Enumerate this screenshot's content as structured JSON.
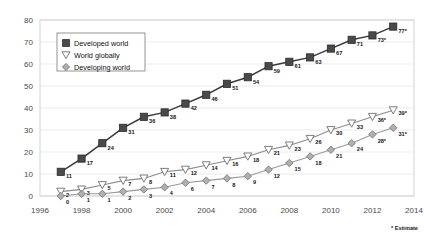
{
  "chart_data": {
    "type": "line",
    "title": "",
    "subtitle": "",
    "xlabel": "",
    "ylabel": "",
    "xlim": [
      1996,
      2014
    ],
    "ylim": [
      0,
      80
    ],
    "x_ticks": [
      "1996",
      "1998",
      "2000",
      "2002",
      "2004",
      "2006",
      "2008",
      "2010",
      "2012",
      "2014"
    ],
    "y_ticks": [
      "0",
      "10",
      "20",
      "30",
      "40",
      "50",
      "60",
      "70",
      "80"
    ],
    "grid": true,
    "legend_position": "upper-left-inside",
    "x": [
      1997,
      1998,
      1999,
      2000,
      2001,
      2002,
      2003,
      2004,
      2005,
      2006,
      2007,
      2008,
      2009,
      2010,
      2011,
      2012,
      2013
    ],
    "series": [
      {
        "name": "Developed world",
        "marker": "filled-square",
        "color": "#3a3a3a",
        "values": [
          11,
          17,
          24,
          31,
          36,
          38,
          42,
          46,
          51,
          54,
          59,
          61,
          63,
          67,
          71,
          73,
          77
        ],
        "labels": [
          "11",
          "17",
          "24",
          "31",
          "36",
          "38",
          "42",
          "46",
          "51",
          "54",
          "59",
          "61",
          "63",
          "67",
          "71",
          "73*",
          "77*"
        ]
      },
      {
        "name": "World globally",
        "marker": "open-triangle-down",
        "color": "#8c8c8c",
        "values": [
          2,
          3,
          5,
          7,
          8,
          11,
          12,
          14,
          16,
          18,
          21,
          23,
          26,
          30,
          33,
          36,
          39
        ],
        "labels": [
          "2",
          "3",
          "5",
          "7",
          "8",
          "11",
          "12",
          "14",
          "16",
          "18",
          "21",
          "23",
          "26",
          "30",
          "33",
          "36*",
          "39*"
        ]
      },
      {
        "name": "Developing world",
        "marker": "diamond",
        "color": "#9a9a9a",
        "values": [
          0,
          1,
          1,
          2,
          3,
          4,
          6,
          7,
          8,
          9,
          12,
          15,
          18,
          21,
          24,
          28,
          31
        ],
        "labels": [
          "0",
          "1",
          "1",
          "2",
          "3",
          "4",
          "6",
          "7",
          "8",
          "9",
          "12",
          "15",
          "18",
          "21",
          "24",
          "28*",
          "31*"
        ]
      }
    ],
    "annotations": [
      "* Estimate"
    ]
  },
  "legend": {
    "entries": [
      {
        "label": "Developed world"
      },
      {
        "label": "World globally"
      },
      {
        "label": "Developing world"
      }
    ]
  },
  "footnote": {
    "text": "* Estimate"
  }
}
